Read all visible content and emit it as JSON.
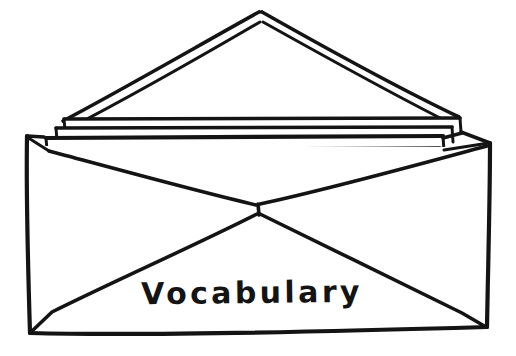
{
  "image": {
    "kind": "line-drawing",
    "subject": "open-envelope-with-letters",
    "description": "Hand-drawn black ink line drawing of an open envelope with its triangular flap raised and several sheets of paper stacked inside, with a handwritten word on the envelope front",
    "background_color": "#ffffff",
    "ink_color": "#141414",
    "width": 516,
    "height": 356
  },
  "handwriting": {
    "front_label": "Vocabulary"
  },
  "parts": [
    {
      "name": "envelope-body",
      "label": "Envelope body"
    },
    {
      "name": "envelope-flap",
      "label": "Open triangular flap"
    },
    {
      "name": "letter-sheets",
      "label": "Stacked letter sheets"
    },
    {
      "name": "envelope-front-seams",
      "label": "Front seam X-fold lines"
    },
    {
      "name": "front-label",
      "label": "Vocabulary"
    }
  ],
  "geometry": {
    "body_top_left": [
      26,
      134
    ],
    "body_top_right": [
      490,
      142
    ],
    "body_bottom_left": [
      30,
      333
    ],
    "body_bottom_right": [
      487,
      327
    ],
    "seam_center": [
      258,
      207
    ],
    "flap_apex_outer": [
      262,
      11
    ],
    "flap_apex_inner": [
      262,
      21
    ],
    "sheet_layers": 3,
    "label_baseline_y": 310
  }
}
